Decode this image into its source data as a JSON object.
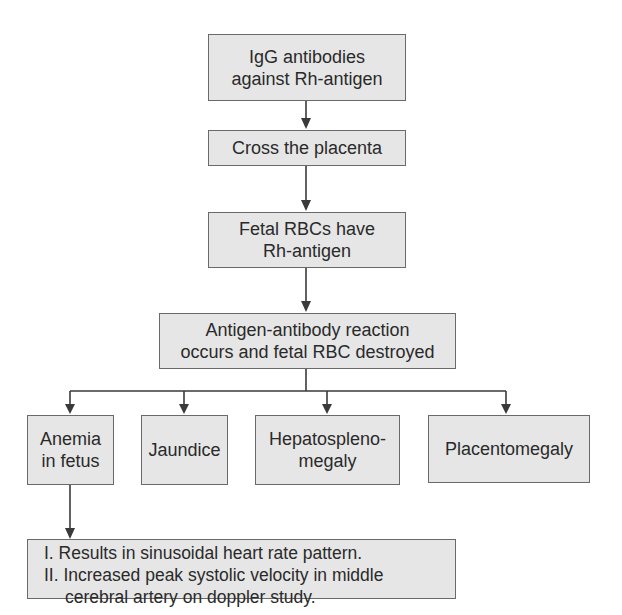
{
  "diagram": {
    "type": "flowchart",
    "colors": {
      "box_fill": "#e6e6e6",
      "box_border": "#6a6a6a",
      "line": "#3a3a3a",
      "text": "#2a2a2a"
    },
    "nodes": {
      "n1": "IgG antibodies\nagainst Rh-antigen",
      "n2": "Cross the placenta",
      "n3": "Fetal RBCs have\nRh-antigen",
      "n4": "Antigen-antibody reaction\noccurs and fetal RBC destroyed",
      "n5": "Anemia\nin fetus",
      "n6": "Jaundice",
      "n7": "Hepatospleno-\nmegaly",
      "n8": "Placentomegaly",
      "n9": {
        "items": [
          "I. Results in sinusoidal heart rate pattern.",
          "II. Increased peak systolic velocity in middle",
          "cerebral artery on doppler study."
        ]
      }
    },
    "edges": [
      [
        "n1",
        "n2"
      ],
      [
        "n2",
        "n3"
      ],
      [
        "n3",
        "n4"
      ],
      [
        "n4",
        "n5"
      ],
      [
        "n4",
        "n6"
      ],
      [
        "n4",
        "n7"
      ],
      [
        "n4",
        "n8"
      ],
      [
        "n5",
        "n9"
      ]
    ]
  }
}
